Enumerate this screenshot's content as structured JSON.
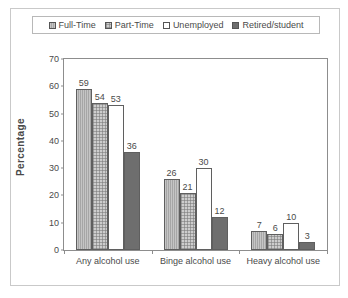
{
  "chart_data": {
    "type": "bar",
    "title": "",
    "xlabel": "",
    "ylabel": "Percentage",
    "ylim": [
      0,
      70
    ],
    "yticks": [
      0,
      10,
      20,
      30,
      40,
      50,
      60,
      70
    ],
    "grid": false,
    "legend_position": "top",
    "categories": [
      "Any alcohol use",
      "Binge alcohol use",
      "Heavy alcohol use"
    ],
    "series": [
      {
        "name": "Full-Time",
        "values": [
          59,
          26,
          7
        ],
        "swatch": "gray-vertical-hatch",
        "color": "#a6a6a6"
      },
      {
        "name": "Part-Time",
        "values": [
          54,
          21,
          6
        ],
        "swatch": "light-gray-dotted",
        "color": "#cdcdcd"
      },
      {
        "name": "Unemployed",
        "values": [
          53,
          30,
          10
        ],
        "swatch": "white-open",
        "color": "#ffffff"
      },
      {
        "name": "Retired/student",
        "values": [
          36,
          12,
          3
        ],
        "swatch": "dark-gray-solid",
        "color": "#6e6e6e"
      }
    ],
    "data_labels": [
      [
        "59",
        "54",
        "53",
        "36"
      ],
      [
        "26",
        "21",
        "30",
        "12"
      ],
      [
        "7",
        "6",
        "10",
        "3"
      ]
    ]
  },
  "legend": {
    "items": [
      {
        "label": "Full-Time"
      },
      {
        "label": "Part-Time"
      },
      {
        "label": "Unemployed"
      },
      {
        "label": "Retired/student"
      }
    ]
  },
  "axis": {
    "y": {
      "label": "Percentage",
      "ticks": [
        "70",
        "60",
        "50",
        "40",
        "30",
        "20",
        "10",
        "0"
      ]
    },
    "x": {
      "ticks": [
        "Any alcohol use",
        "Binge alcohol use",
        "Heavy alcohol use"
      ]
    }
  }
}
